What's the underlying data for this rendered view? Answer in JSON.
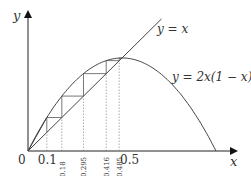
{
  "diagram": {
    "type": "cobweb-plot",
    "axes": {
      "x_label": "x",
      "y_label": "y",
      "origin_label": "0"
    },
    "curves": [
      {
        "label": "y = x",
        "kind": "line"
      },
      {
        "label": "y = 2x(1 − x)",
        "kind": "parabola"
      }
    ],
    "x_ticks": [
      {
        "value": 0.1,
        "label": "0.1",
        "orientation": "horizontal"
      },
      {
        "value": 0.18,
        "label": "0.18",
        "orientation": "vertical"
      },
      {
        "value": 0.295,
        "label": "0.295",
        "orientation": "vertical"
      },
      {
        "value": 0.416,
        "label": "0.416",
        "orientation": "vertical"
      },
      {
        "value": 0.485,
        "label": "0.485",
        "orientation": "vertical"
      },
      {
        "value": 0.5,
        "label": "0.5",
        "orientation": "horizontal"
      }
    ],
    "cobweb_iterates": [
      0.1,
      0.18,
      0.295,
      0.416,
      0.485
    ]
  }
}
